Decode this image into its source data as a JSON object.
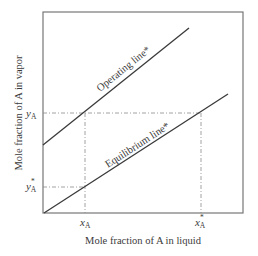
{
  "diagram": {
    "title": "",
    "xlabel": "Mole fraction of A in liquid",
    "ylabel": "Mole fraction of A in vapor",
    "operating_line_label": "Operating line*",
    "equilibrium_line_label": "Equilibrium line*",
    "x_ticks": [
      {
        "base": "x",
        "sub": "A",
        "sup": ""
      },
      {
        "base": "x",
        "sub": "A",
        "sup": "*"
      }
    ],
    "y_ticks": [
      {
        "base": "y",
        "sub": "A",
        "sup": ""
      },
      {
        "base": "y",
        "sub": "A",
        "sup": "*"
      }
    ],
    "colors": {
      "frame": "#6a6a6a",
      "line": "#3a3a3a",
      "dash": "#8a8a8a",
      "text": "#3a3a3a"
    }
  }
}
